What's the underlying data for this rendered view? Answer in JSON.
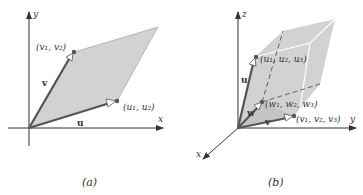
{
  "figure": {
    "panel_a": {
      "caption": "(a)",
      "axis_x": "x",
      "axis_y": "y",
      "vector_u": "u",
      "vector_v": "v",
      "point_u": "(u₁, u₂)",
      "point_v": "(v₁, v₂)",
      "shape": "parallelogram"
    },
    "panel_b": {
      "caption": "(b)",
      "axis_x": "x",
      "axis_y": "y",
      "axis_z": "z",
      "vector_u": "u",
      "vector_v": "v",
      "vector_w": "w",
      "point_u": "(u₁, u₂, u₃)",
      "point_v": "(v₁, v₂, v₃)",
      "point_w": "(w₁, w₂, w₃)",
      "shape": "parallelepiped"
    },
    "colors": {
      "fill": "#d2d2d2",
      "vector": "#555555",
      "axis": "#333333",
      "point": "#555555"
    }
  }
}
